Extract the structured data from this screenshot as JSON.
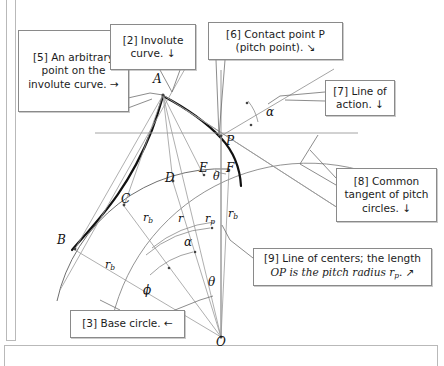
{
  "figure": {
    "background_color": "#ffffff",
    "line_color": "#8a8a8a",
    "bold_curve_color": "#111111"
  },
  "callouts": [
    {
      "id": "callout-5",
      "tag": "[5]",
      "text": "[5] An arbitrary point on the involute curve.  →",
      "arrow": "right-arrow"
    },
    {
      "id": "callout-2",
      "tag": "[2]",
      "text": "[2] Involute curve.  ↓",
      "arrow": "down-arrow"
    },
    {
      "id": "callout-6",
      "tag": "[6]",
      "line1": "[6] Contact point P",
      "line2": "(pitch point).  ↘",
      "arrow": "diagonal-arrow"
    },
    {
      "id": "callout-7",
      "tag": "[7]",
      "text": "[7] Line of action.  ↓",
      "arrow": "down-arrow"
    },
    {
      "id": "callout-8",
      "tag": "[8]",
      "text": "[8] Common tangent of pitch circles.  ↓",
      "arrow": "down-arrow"
    },
    {
      "id": "callout-9",
      "tag": "[9]",
      "line1": "[9] Line of centers; the length",
      "line2": "OP is the pitch radius r",
      "line2_sub": "p",
      "line2_tail": ".  ↗",
      "arrow": "diagonal-arrow"
    },
    {
      "id": "callout-3",
      "tag": "[3]",
      "text": "[3] Base circle.  ←",
      "arrow": "left-arrow"
    }
  ],
  "points": [
    {
      "name": "A",
      "label": "A",
      "x": 163,
      "y": 95
    },
    {
      "name": "B",
      "label": "B",
      "x": 75,
      "y": 248
    },
    {
      "name": "C",
      "label": "C",
      "x": 123,
      "y": 205
    },
    {
      "name": "D",
      "label": "D",
      "x": 172,
      "y": 180
    },
    {
      "name": "E",
      "label": "E",
      "x": 204,
      "y": 171
    },
    {
      "name": "F",
      "label": "F",
      "x": 228,
      "y": 172
    },
    {
      "name": "P",
      "label": "P",
      "x": 220,
      "y": 136
    },
    {
      "name": "O",
      "label": "O",
      "x": 221,
      "y": 337
    }
  ],
  "radius_labels": [
    {
      "name": "r-b-outer",
      "base": "r",
      "sub": "b"
    },
    {
      "name": "r-b-mid",
      "base": "r",
      "sub": "b"
    },
    {
      "name": "r-plain",
      "base": "r",
      "sub": ""
    },
    {
      "name": "r-p",
      "base": "r",
      "sub": "p"
    },
    {
      "name": "r-b-right",
      "base": "r",
      "sub": "b"
    }
  ],
  "angle_labels": [
    {
      "name": "alpha-upper",
      "symbol": "α"
    },
    {
      "name": "alpha-lower",
      "symbol": "α"
    },
    {
      "name": "theta-upper",
      "symbol": "θ"
    },
    {
      "name": "theta-lower",
      "symbol": "θ"
    },
    {
      "name": "phi",
      "symbol": "ϕ"
    }
  ]
}
